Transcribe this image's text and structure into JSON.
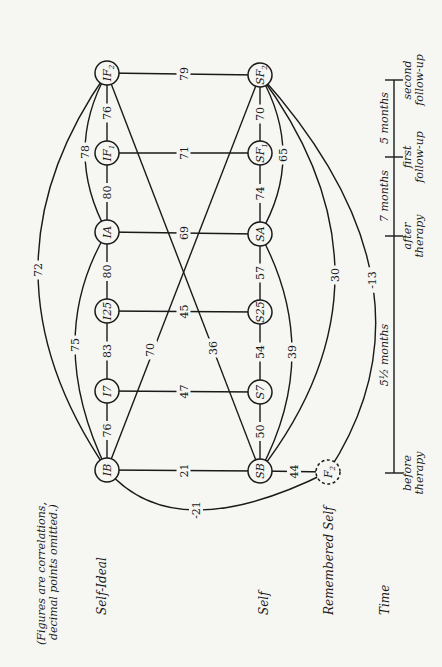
{
  "note": {
    "line1": "(Figures are correlations,",
    "line2": "decimal points omitted.)"
  },
  "row_labels": {
    "self_ideal": "Self-Ideal",
    "self": "Self",
    "remembered_self": "Remembered Self",
    "time": "Time"
  },
  "nodes": [
    {
      "id": "IB",
      "label": "IB",
      "sub": "",
      "x": 107,
      "y": 470,
      "dashed": false
    },
    {
      "id": "I7",
      "label": "I7",
      "sub": "",
      "x": 107,
      "y": 391,
      "dashed": false
    },
    {
      "id": "I25",
      "label": "I25",
      "sub": "",
      "x": 107,
      "y": 311,
      "dashed": false
    },
    {
      "id": "IA",
      "label": "IA",
      "sub": "",
      "x": 107,
      "y": 232,
      "dashed": false
    },
    {
      "id": "IF1",
      "label": "IF",
      "sub": "1",
      "x": 107,
      "y": 153,
      "dashed": false
    },
    {
      "id": "IF2",
      "label": "IF",
      "sub": "2",
      "x": 107,
      "y": 73,
      "dashed": false
    },
    {
      "id": "SB",
      "label": "SB",
      "sub": "",
      "x": 260,
      "y": 471,
      "dashed": false
    },
    {
      "id": "S7",
      "label": "S7",
      "sub": "",
      "x": 260,
      "y": 392,
      "dashed": false
    },
    {
      "id": "S25",
      "label": "S25",
      "sub": "",
      "x": 260,
      "y": 312,
      "dashed": false
    },
    {
      "id": "SA",
      "label": "SA",
      "sub": "",
      "x": 260,
      "y": 234,
      "dashed": false
    },
    {
      "id": "SF1",
      "label": "SF",
      "sub": "1",
      "x": 260,
      "y": 153,
      "dashed": false
    },
    {
      "id": "SF2",
      "label": "SF",
      "sub": "2",
      "x": 260,
      "y": 75,
      "dashed": false
    },
    {
      "id": "F2",
      "label": "F",
      "sub": "2",
      "x": 328,
      "y": 472,
      "dashed": true
    }
  ],
  "edges": [
    {
      "from": "IB",
      "to": "I7",
      "value": "76",
      "type": "straight"
    },
    {
      "from": "I7",
      "to": "I25",
      "value": "83",
      "type": "straight"
    },
    {
      "from": "I25",
      "to": "IA",
      "value": "80",
      "type": "straight"
    },
    {
      "from": "IA",
      "to": "IF1",
      "value": "80",
      "type": "straight"
    },
    {
      "from": "IF1",
      "to": "IF2",
      "value": "76",
      "type": "straight"
    },
    {
      "from": "SB",
      "to": "S7",
      "value": "50",
      "type": "straight"
    },
    {
      "from": "S7",
      "to": "S25",
      "value": "54",
      "type": "straight"
    },
    {
      "from": "S25",
      "to": "SA",
      "value": "57",
      "type": "straight"
    },
    {
      "from": "SA",
      "to": "SF1",
      "value": "74",
      "type": "straight"
    },
    {
      "from": "SF1",
      "to": "SF2",
      "value": "70",
      "type": "straight"
    },
    {
      "from": "IB",
      "to": "SB",
      "value": "21",
      "type": "straight"
    },
    {
      "from": "I7",
      "to": "S7",
      "value": "47",
      "type": "straight"
    },
    {
      "from": "I25",
      "to": "S25",
      "value": "45",
      "type": "straight"
    },
    {
      "from": "IA",
      "to": "SA",
      "value": "69",
      "type": "straight"
    },
    {
      "from": "IF1",
      "to": "SF1",
      "value": "71",
      "type": "straight"
    },
    {
      "from": "IF2",
      "to": "SF2",
      "value": "79",
      "type": "straight"
    },
    {
      "from": "SB",
      "to": "F2",
      "value": "44",
      "type": "straight"
    },
    {
      "from": "IB",
      "to": "SF2",
      "value": "70",
      "type": "diagonal",
      "lx": 150,
      "ly": 350
    },
    {
      "from": "IF2",
      "to": "SB",
      "value": "36",
      "type": "diagonal",
      "lx": 213,
      "ly": 348
    },
    {
      "from": "IB",
      "to": "IF2",
      "value": "72",
      "type": "arc",
      "cx": 38,
      "cy": 270
    },
    {
      "from": "IB",
      "to": "IA",
      "value": "75",
      "type": "arc",
      "cx": 75,
      "cy": 345
    },
    {
      "from": "IA",
      "to": "IF2",
      "value": "78",
      "type": "arc",
      "cx": 85,
      "cy": 152
    },
    {
      "from": "SA",
      "to": "SF2",
      "value": "65",
      "type": "arc",
      "cx": 283,
      "cy": 155
    },
    {
      "from": "SB",
      "to": "SA",
      "value": "39",
      "type": "arc",
      "cx": 292,
      "cy": 352
    },
    {
      "from": "SB",
      "to": "SF2",
      "value": "30",
      "type": "arc",
      "cx": 335,
      "cy": 275
    },
    {
      "from": "F2",
      "to": "SF2",
      "value": "-13",
      "type": "arc",
      "cx": 372,
      "cy": 280
    },
    {
      "from": "IB",
      "to": "F2",
      "value": "-21",
      "type": "arc",
      "cx": 196,
      "cy": 510
    }
  ],
  "timeline": {
    "x": 394,
    "ticks": [
      {
        "y": 473,
        "label1": "before",
        "label2": "therapy"
      },
      {
        "y": 236,
        "label1": "after",
        "label2": "therapy"
      },
      {
        "y": 157,
        "label1": "first",
        "label2": "follow-up"
      },
      {
        "y": 80,
        "label1": "second",
        "label2": "follow-up"
      }
    ],
    "intervals": [
      {
        "y": 355,
        "label": "5½ months"
      },
      {
        "y": 196,
        "label": "7 months"
      },
      {
        "y": 118,
        "label": "5 months"
      }
    ]
  }
}
